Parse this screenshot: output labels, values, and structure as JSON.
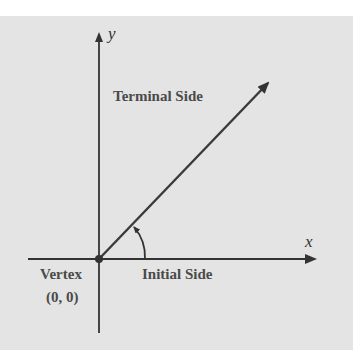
{
  "diagram": {
    "axes": {
      "x_label": "x",
      "y_label": "y"
    },
    "labels": {
      "terminal_side": "Terminal Side",
      "initial_side": "Initial Side",
      "vertex": "Vertex",
      "vertex_coords": "(0, 0)"
    },
    "colors": {
      "panel": "#e4e4e4",
      "line": "#3a3a3a",
      "text": "#4a4a4a"
    }
  }
}
